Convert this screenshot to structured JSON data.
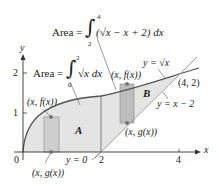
{
  "figure": {
    "formula_top": {
      "lhs": "Area =",
      "upper": "4",
      "lower": "2",
      "integrand": "(√x − x + 2) dx"
    },
    "formula_left": {
      "lhs": "Area =",
      "upper": "2",
      "lower": "0",
      "integrand": "√x dx"
    },
    "curve_labels": {
      "sqrt": "y = √x",
      "line": "y = x − 2",
      "zero": "y = 0"
    },
    "point_labels": {
      "intersection": "(4, 2)",
      "fA_top": "(x, f(x))",
      "gA_bottom": "(x, g(x))",
      "fB_top": "(x, f(x))",
      "gB_bottom": "(x, g(x))"
    },
    "region_labels": {
      "A": "A",
      "B": "B"
    },
    "axes": {
      "x_label": "x",
      "y_label": "y",
      "x_ticks": [
        "0",
        "2",
        "4"
      ],
      "y_ticks": [
        "1",
        "2"
      ]
    },
    "colors": {
      "fill": "#e4e4e4",
      "rect": "#c8c8c8",
      "curve": "#555555",
      "axis": "#333333",
      "point": "#777777"
    }
  }
}
